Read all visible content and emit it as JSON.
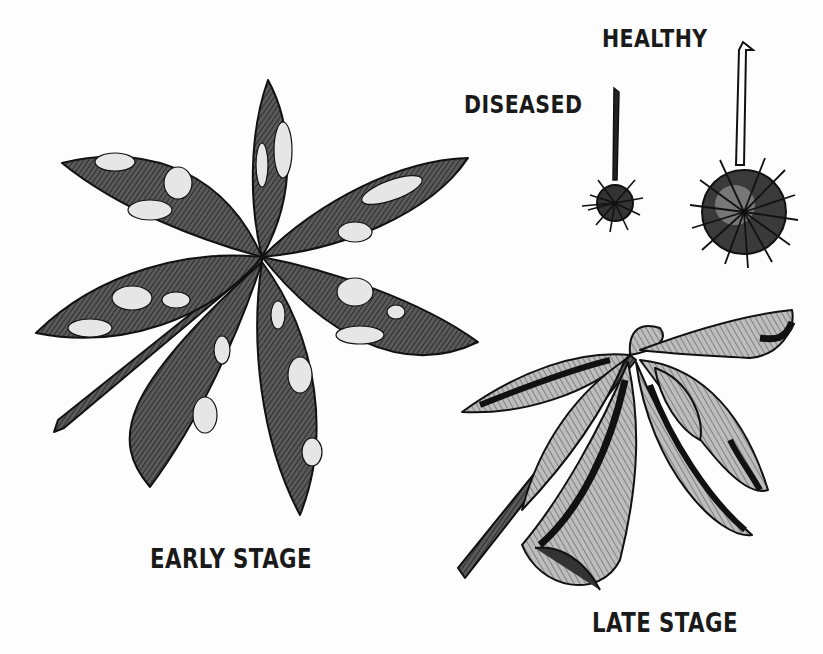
{
  "figure": {
    "labels": {
      "healthy": "HEALTHY",
      "diseased": "DISEASED",
      "early_stage": "EARLY STAGE",
      "late_stage": "LATE STAGE"
    },
    "panels": [
      {
        "id": "early-stage-leaf",
        "description": "Palmate compound leaf with 7 leaflets showing pale blotches"
      },
      {
        "id": "late-stage-leaf",
        "description": "Curled, shriveled palmate leaf with darkened leaflets"
      },
      {
        "id": "diseased-fruit",
        "description": "Small spiny fruit on a thin stalk"
      },
      {
        "id": "healthy-fruit",
        "description": "Large spiny fruit on a longer stalk"
      }
    ],
    "colors": {
      "ink": "#1a1a1a",
      "leaf_fill": "#4a4a4a",
      "blotch": "#e6e6e6",
      "background": "#fdfdfd"
    }
  }
}
